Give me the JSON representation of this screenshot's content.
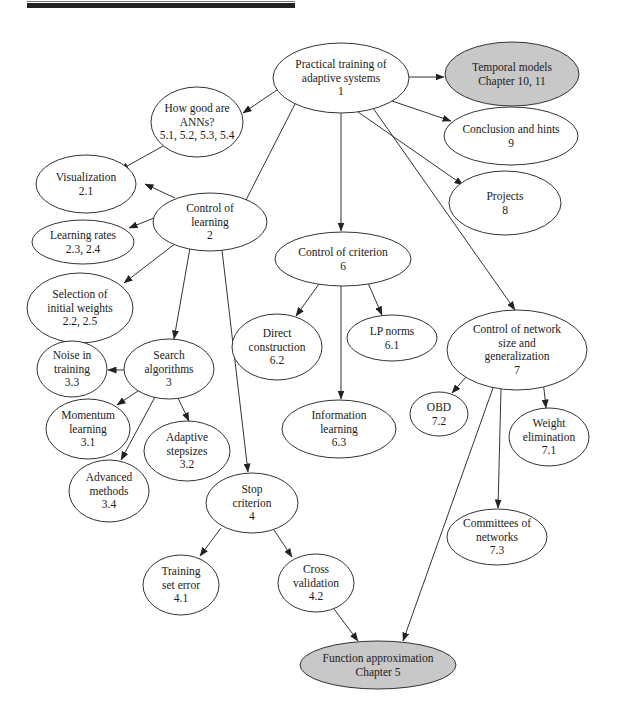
{
  "figure": {
    "kind": "concept-map",
    "colors": {
      "stroke": "#333333",
      "node_fill": "#ffffff",
      "external_fill": "#c8c8c8",
      "rule": "#222222"
    }
  },
  "nodes": [
    {
      "id": "n1",
      "lines": [
        "Practical training of",
        "adaptive systems",
        "1"
      ],
      "cx": 341,
      "cy": 78,
      "rx": 68,
      "ry": 35,
      "external": false
    },
    {
      "id": "temporal",
      "lines": [
        "Temporal models",
        "Chapter 10, 11"
      ],
      "cx": 512,
      "cy": 74,
      "rx": 67,
      "ry": 32,
      "external": true
    },
    {
      "id": "n5",
      "lines": [
        "How good are",
        "ANNs?",
        "5.1, 5.2, 5.3, 5.4"
      ],
      "cx": 197,
      "cy": 122,
      "rx": 46,
      "ry": 35,
      "external": false
    },
    {
      "id": "n9",
      "lines": [
        "Conclusion and hints",
        "9"
      ],
      "cx": 511,
      "cy": 136,
      "rx": 67,
      "ry": 29,
      "external": false
    },
    {
      "id": "n21",
      "lines": [
        "Visualization",
        "2.1"
      ],
      "cx": 86,
      "cy": 184,
      "rx": 50,
      "ry": 29,
      "external": false
    },
    {
      "id": "n2",
      "lines": [
        "Control of",
        "learning",
        "2"
      ],
      "cx": 210,
      "cy": 222,
      "rx": 57,
      "ry": 29,
      "external": false
    },
    {
      "id": "n8",
      "lines": [
        "Projects",
        "8"
      ],
      "cx": 505,
      "cy": 203,
      "rx": 56,
      "ry": 32,
      "external": false
    },
    {
      "id": "n23",
      "lines": [
        "Learning rates",
        "2.3, 2.4"
      ],
      "cx": 83,
      "cy": 242,
      "rx": 51,
      "ry": 22,
      "external": false
    },
    {
      "id": "n6",
      "lines": [
        "Control of criterion",
        "6"
      ],
      "cx": 343,
      "cy": 259,
      "rx": 68,
      "ry": 27,
      "external": false
    },
    {
      "id": "n22",
      "lines": [
        "Selection of",
        "initial weights",
        "2.2, 2.5"
      ],
      "cx": 80,
      "cy": 308,
      "rx": 53,
      "ry": 35,
      "external": false
    },
    {
      "id": "n62",
      "lines": [
        "Direct",
        "construction",
        "6.2"
      ],
      "cx": 277,
      "cy": 347,
      "rx": 45,
      "ry": 33,
      "external": false
    },
    {
      "id": "n61",
      "lines": [
        "LP norms",
        "6.1"
      ],
      "cx": 392,
      "cy": 338,
      "rx": 45,
      "ry": 23,
      "external": false
    },
    {
      "id": "n7",
      "lines": [
        "Control of network",
        "size and",
        "generalization",
        "7"
      ],
      "cx": 517,
      "cy": 350,
      "rx": 70,
      "ry": 40,
      "external": false
    },
    {
      "id": "n33",
      "lines": [
        "Noise in",
        "training",
        "3.3"
      ],
      "cx": 72,
      "cy": 369,
      "rx": 35,
      "ry": 28,
      "external": false
    },
    {
      "id": "n3",
      "lines": [
        "Search",
        "algorithms",
        "3"
      ],
      "cx": 169,
      "cy": 369,
      "rx": 45,
      "ry": 30,
      "external": false
    },
    {
      "id": "n31",
      "lines": [
        "Momentum",
        "learning",
        "3.1"
      ],
      "cx": 88,
      "cy": 429,
      "rx": 42,
      "ry": 30,
      "external": false
    },
    {
      "id": "n32",
      "lines": [
        "Adaptive",
        "stepsizes",
        "3.2"
      ],
      "cx": 187,
      "cy": 451,
      "rx": 43,
      "ry": 30,
      "external": false
    },
    {
      "id": "n72",
      "lines": [
        "OBD",
        "7.2"
      ],
      "cx": 439,
      "cy": 414,
      "rx": 29,
      "ry": 22,
      "external": false
    },
    {
      "id": "n63",
      "lines": [
        "Information",
        "learning",
        "6.3"
      ],
      "cx": 339,
      "cy": 429,
      "rx": 57,
      "ry": 29,
      "external": false
    },
    {
      "id": "n71",
      "lines": [
        "Weight",
        "elimination",
        "7.1"
      ],
      "cx": 549,
      "cy": 437,
      "rx": 40,
      "ry": 29,
      "external": false
    },
    {
      "id": "n34",
      "lines": [
        "Advanced",
        "methods",
        "3.4"
      ],
      "cx": 109,
      "cy": 491,
      "rx": 40,
      "ry": 31,
      "external": false
    },
    {
      "id": "n4",
      "lines": [
        "Stop",
        "criterion",
        "4"
      ],
      "cx": 252,
      "cy": 503,
      "rx": 46,
      "ry": 30,
      "external": false
    },
    {
      "id": "n73",
      "lines": [
        "Committees of",
        "networks",
        "7.3"
      ],
      "cx": 497,
      "cy": 537,
      "rx": 50,
      "ry": 28,
      "external": false
    },
    {
      "id": "n41",
      "lines": [
        "Training",
        "set error",
        "4.1"
      ],
      "cx": 181,
      "cy": 585,
      "rx": 38,
      "ry": 30,
      "external": false
    },
    {
      "id": "n42",
      "lines": [
        "Cross",
        "validation",
        "4.2"
      ],
      "cx": 316,
      "cy": 583,
      "rx": 38,
      "ry": 29,
      "external": false
    },
    {
      "id": "funcapprox",
      "lines": [
        "Function approximation",
        "Chapter 5"
      ],
      "cx": 378,
      "cy": 665,
      "rx": 78,
      "ry": 24,
      "external": true
    }
  ],
  "edges": [
    {
      "from": "n1",
      "to": "temporal",
      "x1": 409,
      "y1": 77,
      "x2": 444,
      "y2": 77
    },
    {
      "from": "n1",
      "to": "n5",
      "x1": 277,
      "y1": 90,
      "x2": 243,
      "y2": 113
    },
    {
      "from": "n1",
      "to": "n9",
      "x1": 392,
      "y1": 101,
      "x2": 451,
      "y2": 121
    },
    {
      "from": "n1",
      "to": "n2",
      "x1": 295,
      "y1": 104,
      "x2": 246,
      "y2": 200,
      "arrow": false
    },
    {
      "from": "n1",
      "to": "n6",
      "x1": 341,
      "y1": 113,
      "x2": 341,
      "y2": 231
    },
    {
      "from": "n1",
      "to": "n8",
      "x1": 358,
      "y1": 112,
      "x2": 463,
      "y2": 185
    },
    {
      "from": "n1",
      "to": "n7",
      "x1": 373,
      "y1": 108,
      "x2": 515,
      "y2": 310
    },
    {
      "from": "n5",
      "to": "n21",
      "x1": 165,
      "y1": 145,
      "x2": 120,
      "y2": 170
    },
    {
      "from": "n2",
      "to": "n21",
      "x1": 175,
      "y1": 198,
      "x2": 145,
      "y2": 184
    },
    {
      "from": "n2",
      "to": "n23",
      "x1": 154,
      "y1": 218,
      "x2": 129,
      "y2": 228
    },
    {
      "from": "n2",
      "to": "n22",
      "x1": 176,
      "y1": 243,
      "x2": 124,
      "y2": 283
    },
    {
      "from": "n2",
      "to": "n3",
      "x1": 190,
      "y1": 248,
      "x2": 174,
      "y2": 339
    },
    {
      "from": "n2",
      "to": "n4",
      "x1": 222,
      "y1": 250,
      "x2": 248,
      "y2": 472
    },
    {
      "from": "n6",
      "to": "n62",
      "x1": 319,
      "y1": 284,
      "x2": 296,
      "y2": 316
    },
    {
      "from": "n6",
      "to": "n61",
      "x1": 368,
      "y1": 283,
      "x2": 382,
      "y2": 315
    },
    {
      "from": "n6",
      "to": "n63",
      "x1": 341,
      "y1": 286,
      "x2": 341,
      "y2": 399
    },
    {
      "from": "n3",
      "to": "n33",
      "x1": 124,
      "y1": 370,
      "x2": 108,
      "y2": 370
    },
    {
      "from": "n3",
      "to": "n31",
      "x1": 138,
      "y1": 391,
      "x2": 117,
      "y2": 405
    },
    {
      "from": "n3",
      "to": "n32",
      "x1": 178,
      "y1": 398,
      "x2": 189,
      "y2": 421
    },
    {
      "from": "n3",
      "to": "n34",
      "x1": 155,
      "y1": 397,
      "x2": 121,
      "y2": 460
    },
    {
      "from": "n7",
      "to": "n72",
      "x1": 466,
      "y1": 377,
      "x2": 452,
      "y2": 393
    },
    {
      "from": "n7",
      "to": "n71",
      "x1": 543,
      "y1": 380,
      "x2": 546,
      "y2": 408
    },
    {
      "from": "n7",
      "to": "n73",
      "x1": 501,
      "y1": 389,
      "x2": 498,
      "y2": 508
    },
    {
      "from": "n7",
      "to": "funcapprox",
      "x1": 493,
      "y1": 388,
      "x2": 403,
      "y2": 641
    },
    {
      "from": "n4",
      "to": "n41",
      "x1": 221,
      "y1": 528,
      "x2": 200,
      "y2": 556
    },
    {
      "from": "n4",
      "to": "n42",
      "x1": 274,
      "y1": 530,
      "x2": 292,
      "y2": 557
    },
    {
      "from": "n42",
      "to": "funcapprox",
      "x1": 334,
      "y1": 609,
      "x2": 358,
      "y2": 641
    }
  ]
}
